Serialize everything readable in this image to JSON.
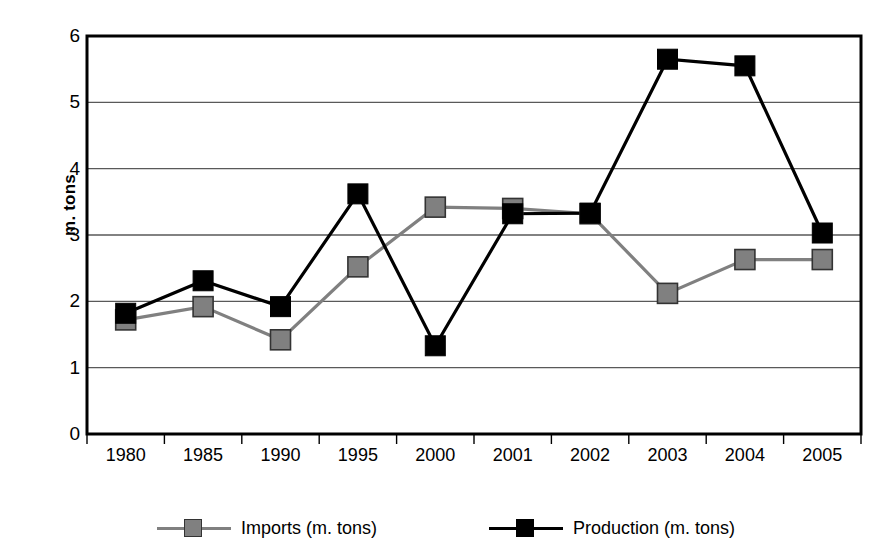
{
  "chart_data": {
    "type": "line",
    "title": "",
    "xlabel": "",
    "ylabel": "m. tons",
    "categories": [
      "1980",
      "1985",
      "1990",
      "1995",
      "2000",
      "2001",
      "2002",
      "2003",
      "2004",
      "2005"
    ],
    "ylim": [
      0,
      6
    ],
    "ytick_labels": [
      "0",
      "1",
      "2",
      "3",
      "4",
      "5",
      "6"
    ],
    "ytick_values": [
      0,
      1,
      2,
      3,
      4,
      5,
      6
    ],
    "grid": true,
    "grid_axis": "y",
    "legend_position": "bottom",
    "series": [
      {
        "name": "Imports (m. tons)",
        "color": "#808080",
        "marker": "square",
        "values": [
          1.72,
          1.92,
          1.42,
          2.52,
          3.42,
          3.4,
          3.32,
          2.12,
          2.63,
          2.63
        ]
      },
      {
        "name": "Production (m. tons)",
        "color": "#000000",
        "marker": "square",
        "values": [
          1.82,
          2.31,
          1.92,
          3.62,
          1.33,
          3.32,
          3.33,
          5.65,
          5.55,
          3.03
        ]
      }
    ]
  },
  "legend": {
    "items": [
      {
        "label": "Imports (m. tons)",
        "color": "#808080"
      },
      {
        "label": "Production (m. tons)",
        "color": "#000000"
      }
    ]
  },
  "axes": {
    "y_title": "m. tons",
    "axis_color": "#000000",
    "grid_color": "#595959",
    "plot_background": "#ffffff"
  }
}
